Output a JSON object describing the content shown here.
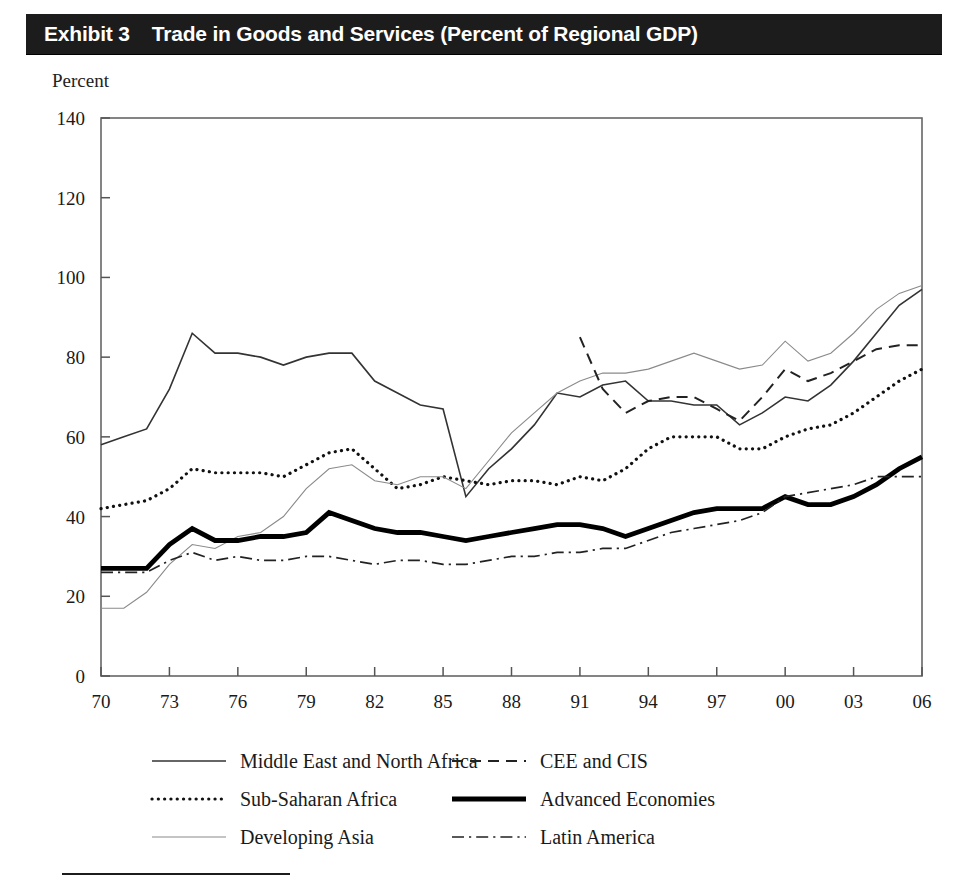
{
  "exhibit": {
    "label": "Exhibit 3",
    "title": "Trade in Goods and Services (Percent of Regional GDP)",
    "unit_caption": "Percent",
    "title_bar_color": "#1c1c1c",
    "title_text_color": "#ffffff"
  },
  "legend": {
    "position": "below-plot",
    "columns": 2,
    "items": [
      {
        "label": "Middle East and North Africa",
        "style": "solid",
        "width": 1.6,
        "color": "#333333",
        "key_icon": "line-solid-icon"
      },
      {
        "label": "CEE and CIS",
        "style": "dashed",
        "width": 1.8,
        "color": "#222222",
        "key_icon": "line-dashed-icon"
      },
      {
        "label": "Sub-Saharan Africa",
        "style": "dotted",
        "width": 3.0,
        "color": "#111111",
        "key_icon": "line-dotted-icon"
      },
      {
        "label": "Advanced Economies",
        "style": "solid-bold",
        "width": 4.6,
        "color": "#000000",
        "key_icon": "line-bold-icon"
      },
      {
        "label": "Developing Asia",
        "style": "solid-thin",
        "width": 1.0,
        "color": "#888888",
        "key_icon": "line-thin-icon"
      },
      {
        "label": "Latin America",
        "style": "dash-dot",
        "width": 1.6,
        "color": "#222222",
        "key_icon": "line-dash-dot-icon"
      }
    ]
  },
  "chart_data": {
    "type": "line",
    "title": "Trade in Goods and Services (Percent of Regional GDP)",
    "xlabel": "",
    "ylabel": "Percent",
    "ylim": [
      0,
      140
    ],
    "ytick_step": 20,
    "yticks": [
      0,
      20,
      40,
      60,
      80,
      100,
      120,
      140
    ],
    "ytick_labels": [
      "0",
      "20",
      "40",
      "60",
      "80",
      "100",
      "120",
      "140"
    ],
    "xlim": [
      1970,
      2006
    ],
    "xticks": [
      1970,
      1973,
      1976,
      1979,
      1982,
      1985,
      1988,
      1991,
      1994,
      1997,
      2000,
      2003,
      2006
    ],
    "xtick_labels": [
      "70",
      "73",
      "76",
      "79",
      "82",
      "85",
      "88",
      "91",
      "94",
      "97",
      "00",
      "03",
      "06"
    ],
    "x": [
      1970,
      1971,
      1972,
      1973,
      1974,
      1975,
      1976,
      1977,
      1978,
      1979,
      1980,
      1981,
      1982,
      1983,
      1984,
      1985,
      1986,
      1987,
      1988,
      1989,
      1990,
      1991,
      1992,
      1993,
      1994,
      1995,
      1996,
      1997,
      1998,
      1999,
      2000,
      2001,
      2002,
      2003,
      2004,
      2005,
      2006
    ],
    "grid": false,
    "legend_position": "bottom",
    "series": [
      {
        "name": "Middle East and North Africa",
        "style": "solid",
        "values": [
          58,
          60,
          62,
          72,
          86,
          81,
          81,
          80,
          78,
          80,
          81,
          81,
          74,
          71,
          68,
          67,
          45,
          52,
          57,
          63,
          71,
          70,
          73,
          74,
          69,
          69,
          68,
          68,
          63,
          66,
          70,
          69,
          73,
          79,
          86,
          93,
          97
        ]
      },
      {
        "name": "Sub-Saharan Africa",
        "style": "dotted",
        "values": [
          42,
          43,
          44,
          47,
          52,
          51,
          51,
          51,
          50,
          53,
          56,
          57,
          52,
          47,
          48,
          50,
          49,
          48,
          49,
          49,
          48,
          50,
          49,
          52,
          57,
          60,
          60,
          60,
          57,
          57,
          60,
          62,
          63,
          66,
          70,
          74,
          77
        ]
      },
      {
        "name": "Developing Asia",
        "style": "solid-thin",
        "values": [
          17,
          17,
          21,
          28,
          33,
          32,
          35,
          36,
          40,
          47,
          52,
          53,
          49,
          48,
          50,
          50,
          47,
          54,
          61,
          66,
          71,
          74,
          76,
          76,
          77,
          79,
          81,
          79,
          77,
          78,
          84,
          79,
          81,
          86,
          92,
          96,
          98
        ]
      },
      {
        "name": "CEE and CIS",
        "style": "dashed",
        "values": [
          null,
          null,
          null,
          null,
          null,
          null,
          null,
          null,
          null,
          null,
          null,
          null,
          null,
          null,
          null,
          null,
          null,
          null,
          null,
          null,
          null,
          85,
          72,
          66,
          69,
          70,
          70,
          67,
          64,
          70,
          77,
          74,
          76,
          79,
          82,
          83,
          83
        ]
      },
      {
        "name": "Advanced Economies",
        "style": "solid-bold",
        "values": [
          27,
          27,
          27,
          33,
          37,
          34,
          34,
          35,
          35,
          36,
          41,
          39,
          37,
          36,
          36,
          35,
          34,
          35,
          36,
          37,
          38,
          38,
          37,
          35,
          37,
          39,
          41,
          42,
          42,
          42,
          45,
          43,
          43,
          45,
          48,
          52,
          55
        ]
      },
      {
        "name": "Latin America",
        "style": "dash-dot",
        "values": [
          26,
          26,
          26,
          29,
          31,
          29,
          30,
          29,
          29,
          30,
          30,
          29,
          28,
          29,
          29,
          28,
          28,
          29,
          30,
          30,
          31,
          31,
          32,
          32,
          34,
          36,
          37,
          38,
          39,
          41,
          45,
          46,
          47,
          48,
          50,
          50,
          50
        ]
      }
    ]
  }
}
